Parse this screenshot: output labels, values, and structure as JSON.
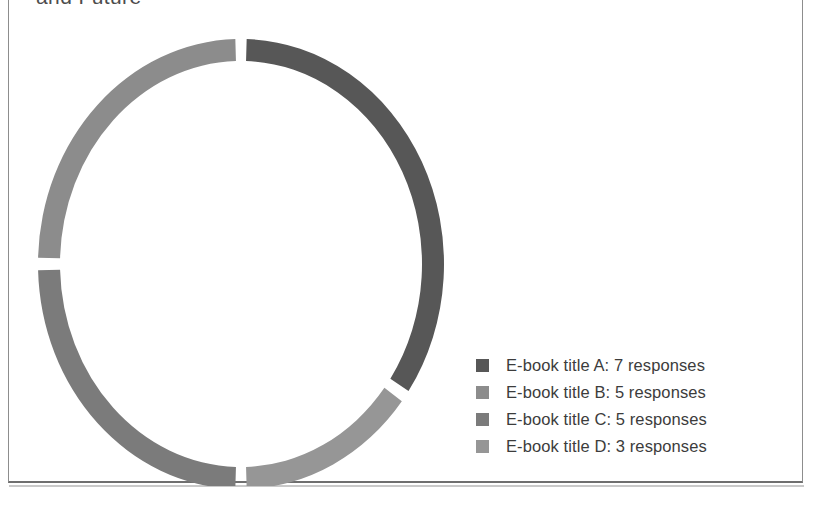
{
  "page": {
    "title_fragment": "and Future",
    "background": "#ffffff",
    "frame_color": "#8d8d8d"
  },
  "chart_data": {
    "type": "pie",
    "variant": "donut",
    "title": "and Future",
    "xlabel": "",
    "ylabel": "",
    "categories": [
      "E-book title A",
      "E-book title B",
      "E-book title C",
      "E-book title D"
    ],
    "values": [
      7,
      5,
      5,
      3
    ],
    "unit": "responses",
    "total": 20,
    "legend_position": "right-bottom",
    "grid": false,
    "start_angle_deg": 0,
    "direction": "clockwise",
    "slice_order_clockwise_from_top": [
      "E-book title A",
      "E-book title D",
      "E-book title C",
      "E-book title B"
    ],
    "slice_angles_deg": {
      "E-book title A": 126,
      "E-book title D": 54,
      "E-book title C": 90,
      "E-book title B": 90
    },
    "slice_percent": {
      "E-book title A": 35,
      "E-book title B": 25,
      "E-book title C": 25,
      "E-book title D": 15
    },
    "colors": {
      "E-book title A": "#575757",
      "E-book title B": "#8c8c8c",
      "E-book title C": "#7b7b7b",
      "E-book title D": "#969696"
    }
  },
  "legend": {
    "items": [
      {
        "label": "E-book title A: 7 responses",
        "color": "#575757"
      },
      {
        "label": "E-book title B: 5 responses",
        "color": "#8c8c8c"
      },
      {
        "label": "E-book title C: 5 responses",
        "color": "#7b7b7b"
      },
      {
        "label": "E-book title D: 3 responses",
        "color": "#969696"
      }
    ]
  }
}
